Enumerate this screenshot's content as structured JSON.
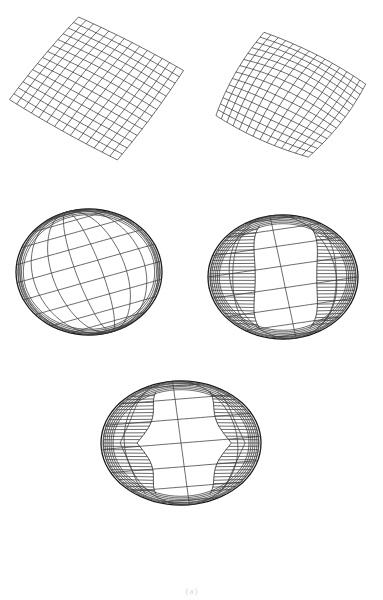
{
  "figure": {
    "background": "#ffffff",
    "line_color": "#3a3a3a",
    "caption": "(a)",
    "panels": [
      {
        "id": "panel-1",
        "stage": "flat grid, slightly bulged",
        "type": "grid",
        "corners": [
          [
            78,
            15
          ],
          [
            186,
            70
          ],
          [
            118,
            162
          ],
          [
            7,
            100
          ]
        ],
        "rows": 14,
        "cols": 14,
        "bulge": 8
      },
      {
        "id": "panel-2",
        "stage": "grid wrapping into dome",
        "type": "grid",
        "corners": [
          [
            262,
            27
          ],
          [
            372,
            83
          ],
          [
            310,
            162
          ],
          [
            210,
            117
          ]
        ],
        "rows": 14,
        "cols": 14,
        "bulge": 22
      },
      {
        "id": "panel-3",
        "stage": "closed sphere",
        "type": "sphere",
        "cx": 89,
        "cy": 272,
        "rx": 73,
        "ry": 63,
        "tilt": -18,
        "lat": 11,
        "lon": 9,
        "holes": 0
      },
      {
        "id": "panel-4",
        "stage": "sphere with two side cut-outs",
        "type": "sphere",
        "cx": 283,
        "cy": 277,
        "rx": 75,
        "ry": 62,
        "tilt": -10,
        "lat": 9,
        "lon": 18,
        "holes": 1
      },
      {
        "id": "panel-5",
        "stage": "sphere with stacked lobed cut-outs",
        "type": "sphere",
        "cx": 181,
        "cy": 443,
        "rx": 80,
        "ry": 62,
        "tilt": -6,
        "lat": 8,
        "lon": 22,
        "holes": 2
      }
    ]
  }
}
